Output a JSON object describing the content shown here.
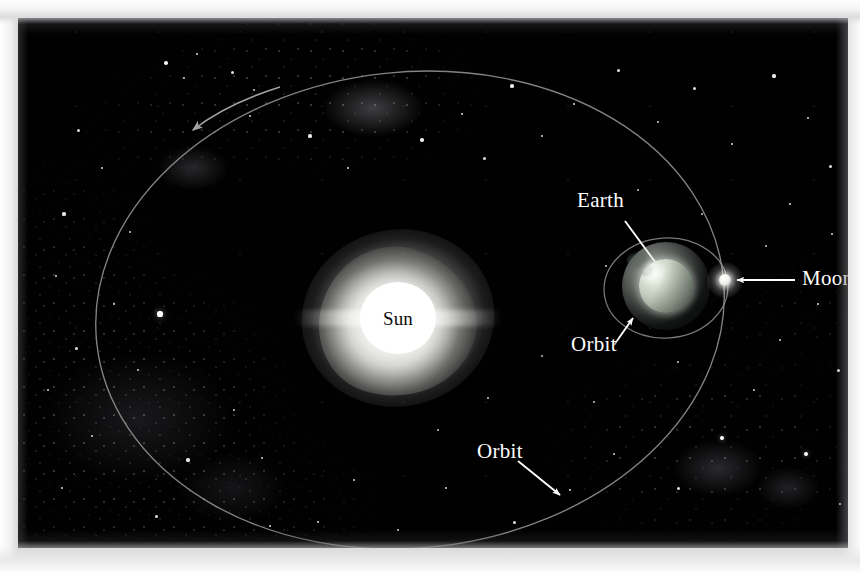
{
  "figure": {
    "medium": "astronomy illustration photograph",
    "background_color": "#010102",
    "frame_color": "#d8d8d8"
  },
  "bodies": {
    "sun": {
      "name": "Sun",
      "label": "Sun",
      "label_color": "#0b0b0b",
      "disc_color": "#ffffff",
      "glow_color": "#f4f4f0",
      "center_x": 380,
      "center_y": 300,
      "radius": 38
    },
    "earth": {
      "name": "Earth",
      "label": "Earth",
      "label_color": "#ffffff",
      "disc_color": "#c4cec0",
      "highlight_color": "#f4f7f0",
      "center_x": 648,
      "center_y": 268,
      "radius": 27
    },
    "moon": {
      "name": "Moon",
      "label": "Moon",
      "label_color": "#ffffff",
      "disc_color": "#ffffff",
      "center_x": 707,
      "center_y": 262,
      "radius": 6
    }
  },
  "orbits": {
    "earth_orbit": {
      "label": "Orbit",
      "description": "Earth's orbit around the Sun",
      "stroke_color": "#9a9a9a",
      "center_x": 392,
      "center_y": 292,
      "radius_x": 315,
      "radius_y": 238,
      "rotation_deg": -6,
      "direction": "counterclockwise",
      "has_direction_arrow": true,
      "arrow_x": 175,
      "arrow_y": 112
    },
    "moon_orbit": {
      "label": "Orbit",
      "description": "Moon's orbit around the Earth",
      "stroke_color": "#8f8f8f",
      "center_x": 648,
      "center_y": 270,
      "radius_x": 62,
      "radius_y": 50,
      "rotation_deg": -4
    }
  },
  "callouts": [
    {
      "id": "earth",
      "text": "Earth",
      "text_x": 559,
      "text_y": 172,
      "arrow_from_x": 607,
      "arrow_from_y": 203,
      "arrow_to_x": 643,
      "arrow_to_y": 252,
      "points_to": "Earth"
    },
    {
      "id": "moon",
      "text": "Moon",
      "text_x": 784,
      "text_y": 250,
      "arrow_from_x": 777,
      "arrow_from_y": 262,
      "arrow_to_x": 719,
      "arrow_to_y": 262,
      "points_to": "Moon"
    },
    {
      "id": "orbit-moon",
      "text": "Orbit",
      "text_x": 553,
      "text_y": 316,
      "arrow_from_x": 596,
      "arrow_from_y": 327,
      "arrow_to_x": 615,
      "arrow_to_y": 300,
      "points_to": "Moon orbit"
    },
    {
      "id": "orbit-sun",
      "text": "Orbit",
      "text_x": 459,
      "text_y": 423,
      "arrow_from_x": 500,
      "arrow_from_y": 443,
      "arrow_to_x": 542,
      "arrow_to_y": 477,
      "points_to": "Earth orbit"
    }
  ],
  "stars": [
    {
      "x": 148,
      "y": 45,
      "r": 1.8
    },
    {
      "x": 179,
      "y": 36,
      "r": 1.4
    },
    {
      "x": 214,
      "y": 54,
      "r": 1.5
    },
    {
      "x": 236,
      "y": 72,
      "r": 1.3
    },
    {
      "x": 232,
      "y": 98,
      "r": 1.2
    },
    {
      "x": 166,
      "y": 60,
      "r": 1.1
    },
    {
      "x": 60,
      "y": 112,
      "r": 1.5
    },
    {
      "x": 84,
      "y": 150,
      "r": 1.3
    },
    {
      "x": 46,
      "y": 196,
      "r": 1.6
    },
    {
      "x": 112,
      "y": 214,
      "r": 1.2
    },
    {
      "x": 38,
      "y": 258,
      "r": 1.4
    },
    {
      "x": 96,
      "y": 286,
      "r": 1.2
    },
    {
      "x": 142,
      "y": 296,
      "r": 2.6
    },
    {
      "x": 58,
      "y": 330,
      "r": 1.5
    },
    {
      "x": 30,
      "y": 372,
      "r": 1.3
    },
    {
      "x": 120,
      "y": 352,
      "r": 1.3
    },
    {
      "x": 74,
      "y": 418,
      "r": 1.4
    },
    {
      "x": 170,
      "y": 442,
      "r": 1.6
    },
    {
      "x": 216,
      "y": 392,
      "r": 1.2
    },
    {
      "x": 44,
      "y": 470,
      "r": 1.3
    },
    {
      "x": 138,
      "y": 498,
      "r": 1.5
    },
    {
      "x": 252,
      "y": 508,
      "r": 1.4
    },
    {
      "x": 292,
      "y": 118,
      "r": 1.6
    },
    {
      "x": 330,
      "y": 150,
      "r": 1.3
    },
    {
      "x": 404,
      "y": 122,
      "r": 1.7
    },
    {
      "x": 444,
      "y": 96,
      "r": 1.4
    },
    {
      "x": 466,
      "y": 140,
      "r": 1.5
    },
    {
      "x": 494,
      "y": 68,
      "r": 1.6
    },
    {
      "x": 524,
      "y": 118,
      "r": 1.3
    },
    {
      "x": 556,
      "y": 86,
      "r": 1.4
    },
    {
      "x": 600,
      "y": 52,
      "r": 1.5
    },
    {
      "x": 640,
      "y": 104,
      "r": 1.3
    },
    {
      "x": 676,
      "y": 70,
      "r": 1.5
    },
    {
      "x": 714,
      "y": 126,
      "r": 1.4
    },
    {
      "x": 756,
      "y": 58,
      "r": 1.6
    },
    {
      "x": 790,
      "y": 100,
      "r": 1.3
    },
    {
      "x": 812,
      "y": 148,
      "r": 1.5
    },
    {
      "x": 772,
      "y": 186,
      "r": 1.4
    },
    {
      "x": 814,
      "y": 216,
      "r": 1.3
    },
    {
      "x": 748,
      "y": 228,
      "r": 1.2
    },
    {
      "x": 800,
      "y": 286,
      "r": 1.4
    },
    {
      "x": 762,
      "y": 322,
      "r": 1.3
    },
    {
      "x": 820,
      "y": 352,
      "r": 1.5
    },
    {
      "x": 736,
      "y": 372,
      "r": 1.3
    },
    {
      "x": 704,
      "y": 420,
      "r": 2.4
    },
    {
      "x": 788,
      "y": 436,
      "r": 2.2
    },
    {
      "x": 660,
      "y": 470,
      "r": 1.5
    },
    {
      "x": 822,
      "y": 486,
      "r": 1.4
    },
    {
      "x": 596,
      "y": 436,
      "r": 1.3
    },
    {
      "x": 552,
      "y": 472,
      "r": 1.4
    },
    {
      "x": 496,
      "y": 504,
      "r": 1.5
    },
    {
      "x": 428,
      "y": 470,
      "r": 1.4
    },
    {
      "x": 380,
      "y": 512,
      "r": 1.3
    },
    {
      "x": 336,
      "y": 462,
      "r": 1.2
    },
    {
      "x": 300,
      "y": 504,
      "r": 1.4
    },
    {
      "x": 244,
      "y": 440,
      "r": 1.3
    },
    {
      "x": 420,
      "y": 412,
      "r": 1.2
    },
    {
      "x": 470,
      "y": 380,
      "r": 1.1
    },
    {
      "x": 620,
      "y": 172,
      "r": 1.2
    },
    {
      "x": 588,
      "y": 248,
      "r": 1.0
    },
    {
      "x": 684,
      "y": 196,
      "r": 1.1
    },
    {
      "x": 660,
      "y": 344,
      "r": 1.2
    },
    {
      "x": 576,
      "y": 384,
      "r": 1.1
    },
    {
      "x": 524,
      "y": 338,
      "r": 1.0
    }
  ]
}
